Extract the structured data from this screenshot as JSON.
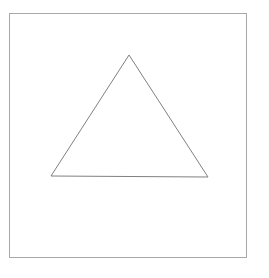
{
  "figure": {
    "title": "Triangle outline inside rectangular frame",
    "background_color": "#ffffff",
    "canvas": {
      "width": 269,
      "height": 278
    },
    "frame": {
      "name": "border-frame",
      "x": 9,
      "y": 13,
      "width": 238,
      "height": 245,
      "stroke_color": "#a8a8a8",
      "stroke_width": 1,
      "fill": "none"
    },
    "triangle": {
      "name": "triangle-outline",
      "kind": "equilateral",
      "stroke_color": "#808080",
      "stroke_width": 1,
      "fill": "none",
      "points": "129,55 208,177 51,176",
      "vertices": [
        {
          "label": "apex",
          "x": 129,
          "y": 55
        },
        {
          "label": "base-right",
          "x": 208,
          "y": 177
        },
        {
          "label": "base-left",
          "x": 51,
          "y": 176
        }
      ],
      "base_length": 157,
      "height": 122
    }
  },
  "chart_data": {
    "type": "scatter",
    "title": "Triangle outline inside rectangular frame",
    "xlabel": "",
    "ylabel": "",
    "xlim": [
      0,
      269
    ],
    "ylim": [
      0,
      278
    ],
    "grid": false,
    "legend": "none",
    "series": [
      {
        "name": "border-frame",
        "shape": "rectangle",
        "x": [
          9,
          247,
          247,
          9,
          9
        ],
        "y": [
          13,
          13,
          258,
          258,
          13
        ],
        "color": "#a8a8a8"
      },
      {
        "name": "triangle-outline",
        "shape": "polygon",
        "x": [
          129,
          208,
          51,
          129
        ],
        "y": [
          55,
          177,
          176,
          55
        ],
        "color": "#808080"
      }
    ]
  }
}
